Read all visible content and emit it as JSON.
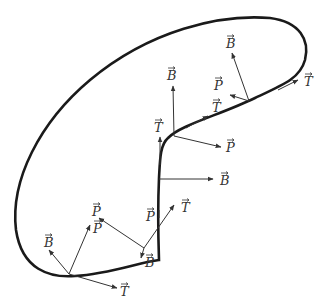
{
  "diagram": {
    "title": "",
    "colors": {
      "curve": "#1a1a1a",
      "vector": "#333333",
      "label": "#333333",
      "background": "#ffffff"
    },
    "labels": {
      "t1": "T",
      "p1": "P",
      "b1": "B",
      "t2": "T",
      "p2": "P",
      "b2": "B",
      "t3": "T",
      "p3": "P",
      "b3": "B",
      "t4": "T",
      "p4": "P",
      "b4": "B",
      "t5": "T",
      "p5": "P",
      "b5": "B",
      "t6": "T"
    },
    "frames": [
      {
        "point": [
          69,
          274
        ],
        "vectors": [
          "T",
          "P",
          "B"
        ]
      },
      {
        "point": [
          144,
          248
        ],
        "vectors": [
          "T",
          "P",
          "B"
        ]
      },
      {
        "point": [
          159,
          180
        ],
        "vectors": [
          "T",
          "B"
        ]
      },
      {
        "point": [
          176,
          135
        ],
        "vectors": [
          "T",
          "P",
          "B"
        ]
      },
      {
        "point": [
          249,
          101
        ],
        "vectors": [
          "T",
          "P",
          "B"
        ]
      },
      {
        "point": [
          282,
          90
        ],
        "vectors": [
          "T"
        ]
      }
    ]
  }
}
